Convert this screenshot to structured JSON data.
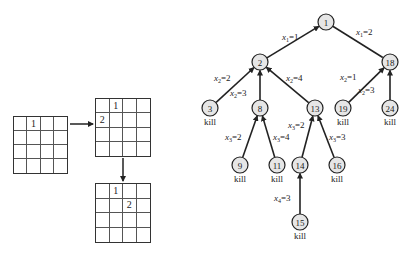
{
  "colors": {
    "node_fill": "#e6e6e6",
    "stroke": "#222222",
    "background": "#ffffff"
  },
  "boards": [
    {
      "id": "board-1",
      "x": 13,
      "y": 116,
      "w": 55,
      "h": 58,
      "cells": [
        "",
        "1",
        "",
        "",
        "",
        "",
        "",
        "",
        "",
        "",
        "",
        "",
        "",
        "",
        "",
        ""
      ]
    },
    {
      "id": "board-2",
      "x": 95,
      "y": 98,
      "w": 56,
      "h": 59,
      "cells": [
        "",
        "1",
        "",
        "",
        "2",
        "",
        "",
        "",
        "",
        "",
        "",
        "",
        "",
        "",
        "",
        ""
      ]
    },
    {
      "id": "board-3",
      "x": 95,
      "y": 183,
      "w": 56,
      "h": 60,
      "cells": [
        "",
        "1",
        "",
        "",
        "",
        "",
        "2",
        "",
        "",
        "",
        "",
        "",
        "",
        "",
        "",
        ""
      ]
    }
  ],
  "board_arrows": [
    {
      "id": "arrow-right",
      "x1": 70,
      "y1": 124,
      "x2": 93,
      "y2": 124
    },
    {
      "id": "arrow-down",
      "x1": 123,
      "y1": 158,
      "x2": 123,
      "y2": 181
    }
  ],
  "tree": {
    "nodes": [
      {
        "id": "1",
        "label": "1",
        "x": 326,
        "y": 22,
        "kill": ""
      },
      {
        "id": "2",
        "label": "2",
        "x": 260,
        "y": 62,
        "kill": ""
      },
      {
        "id": "18",
        "label": "18",
        "x": 390,
        "y": 62,
        "kill": ""
      },
      {
        "id": "3",
        "label": "3",
        "x": 210,
        "y": 108,
        "kill": "kill"
      },
      {
        "id": "8",
        "label": "8",
        "x": 260,
        "y": 108,
        "kill": ""
      },
      {
        "id": "13",
        "label": "13",
        "x": 315,
        "y": 108,
        "kill": ""
      },
      {
        "id": "19",
        "label": "19",
        "x": 343,
        "y": 108,
        "kill": "kill"
      },
      {
        "id": "24",
        "label": "24",
        "x": 390,
        "y": 108,
        "kill": "kill"
      },
      {
        "id": "9",
        "label": "9",
        "x": 240,
        "y": 165,
        "kill": "kill"
      },
      {
        "id": "11",
        "label": "11",
        "x": 277,
        "y": 165,
        "kill": "kill"
      },
      {
        "id": "14",
        "label": "14",
        "x": 300,
        "y": 165,
        "kill": ""
      },
      {
        "id": "16",
        "label": "16",
        "x": 337,
        "y": 165,
        "kill": "kill"
      },
      {
        "id": "15",
        "label": "15",
        "x": 300,
        "y": 222,
        "kill": "kill"
      }
    ],
    "edges": [
      {
        "from": "2",
        "to": "1",
        "arrow": true,
        "sub": "1",
        "value": "1",
        "lx": 282,
        "ly": 40
      },
      {
        "from": "1",
        "to": "18",
        "arrow": false,
        "sub": "1",
        "value": "2",
        "lx": 356,
        "ly": 35
      },
      {
        "from": "3",
        "to": "2",
        "arrow": true,
        "sub": "2",
        "value": "2",
        "lx": 214,
        "ly": 81
      },
      {
        "from": "8",
        "to": "2",
        "arrow": true,
        "sub": "2",
        "value": "3",
        "lx": 230,
        "ly": 96
      },
      {
        "from": "13",
        "to": "2",
        "arrow": true,
        "sub": "2",
        "value": "4",
        "lx": 286,
        "ly": 81
      },
      {
        "from": "19",
        "to": "18",
        "arrow": true,
        "sub": "2",
        "value": "1",
        "lx": 340,
        "ly": 80
      },
      {
        "from": "24",
        "to": "18",
        "arrow": true,
        "sub": "2",
        "value": "3",
        "lx": 358,
        "ly": 93
      },
      {
        "from": "9",
        "to": "8",
        "arrow": true,
        "sub": "3",
        "value": "2",
        "lx": 225,
        "ly": 140
      },
      {
        "from": "11",
        "to": "8",
        "arrow": true,
        "sub": "3",
        "value": "4",
        "lx": 273,
        "ly": 140
      },
      {
        "from": "14",
        "to": "13",
        "arrow": true,
        "sub": "3",
        "value": "2",
        "lx": 288,
        "ly": 128
      },
      {
        "from": "16",
        "to": "13",
        "arrow": true,
        "sub": "3",
        "value": "3",
        "lx": 329,
        "ly": 140
      },
      {
        "from": "15",
        "to": "14",
        "arrow": true,
        "sub": "4",
        "value": "3",
        "lx": 274,
        "ly": 201
      }
    ]
  }
}
